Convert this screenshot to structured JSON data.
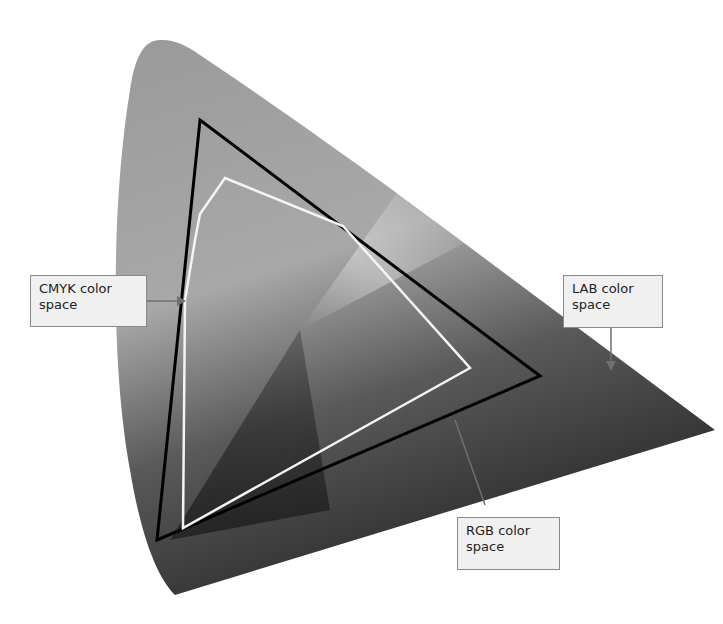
{
  "diagram": {
    "labels": {
      "cmyk": {
        "line1": "CMYK color",
        "line2": "space"
      },
      "lab": {
        "line1": "LAB color",
        "line2": "space"
      },
      "rgb": {
        "line1": "RGB color",
        "line2": "space"
      }
    },
    "colors": {
      "background": "#ffffff",
      "lab_fill_light": "#b4b4b4",
      "lab_fill_dark": "#3a3a3a",
      "rgb_outline": "#000000",
      "cmyk_outline": "#f4f4f4",
      "label_bg": "#f0f0f0",
      "label_border": "#8a8a8a",
      "arrow": "#707070"
    },
    "shapes": {
      "lab_region": "LAB gamut horseshoe/triangle, apex top-left at (150,40), right tip at (715,430), bottom at (175,595)",
      "rgb_triangle": [
        [
          200,
          120
        ],
        [
          540,
          376
        ],
        [
          157,
          540
        ]
      ],
      "cmyk_polygon": [
        [
          225,
          178
        ],
        [
          343,
          226
        ],
        [
          470,
          368
        ],
        [
          183,
          528
        ],
        [
          185,
          300
        ],
        [
          200,
          214
        ]
      ]
    }
  }
}
